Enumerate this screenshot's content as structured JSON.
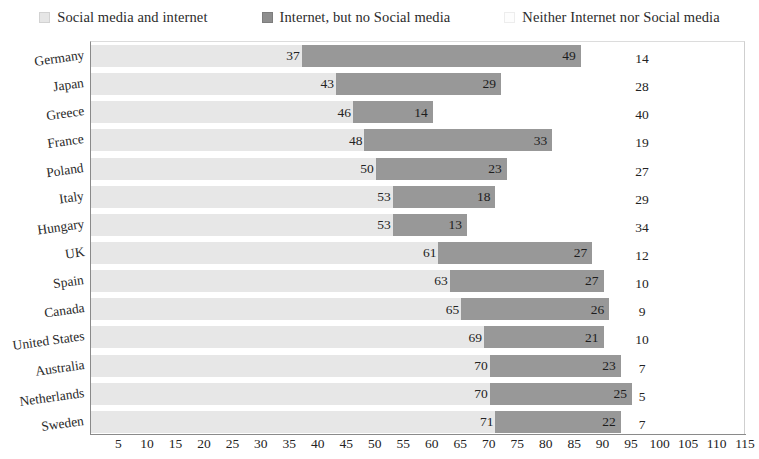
{
  "legend": {
    "items": [
      {
        "label": "Social media and internet",
        "swatch": "light-gray-square-icon",
        "color": "#e6e6e6"
      },
      {
        "label": "Internet, but no Social media",
        "swatch": "dark-gray-square-icon",
        "color": "#8e8e8e"
      },
      {
        "label": "Neither Internet nor Social media",
        "swatch": "white-square-icon",
        "color": "#fdfdfd"
      }
    ]
  },
  "chart_data": {
    "type": "bar",
    "title": "",
    "subtitle": "",
    "xlabel": "",
    "ylabel": "",
    "orientation": "horizontal",
    "stacked": true,
    "grid": false,
    "legend_position": "top",
    "xlim": [
      0,
      115
    ],
    "xticks": [
      5,
      10,
      15,
      20,
      25,
      30,
      35,
      40,
      45,
      50,
      55,
      60,
      65,
      70,
      75,
      80,
      85,
      90,
      95,
      100,
      105,
      110,
      115
    ],
    "categories": [
      "Germany",
      "Japan",
      "Greece",
      "France",
      "Poland",
      "Italy",
      "Hungary",
      "UK",
      "Spain",
      "Canada",
      "United States",
      "Australia",
      "Netherlands",
      "Sweden"
    ],
    "series": [
      {
        "name": "Social media and internet",
        "color": "#e7e7e7",
        "values": [
          37,
          43,
          46,
          48,
          50,
          53,
          53,
          61,
          63,
          65,
          69,
          70,
          70,
          71
        ]
      },
      {
        "name": "Internet, but no Social media",
        "color": "#989898",
        "values": [
          49,
          29,
          14,
          33,
          23,
          18,
          13,
          27,
          27,
          26,
          21,
          23,
          25,
          22
        ]
      },
      {
        "name": "Neither Internet nor Social media",
        "color": "#fdfdfd",
        "values": [
          14,
          28,
          40,
          19,
          27,
          29,
          34,
          12,
          10,
          9,
          10,
          7,
          5,
          7
        ]
      }
    ]
  }
}
